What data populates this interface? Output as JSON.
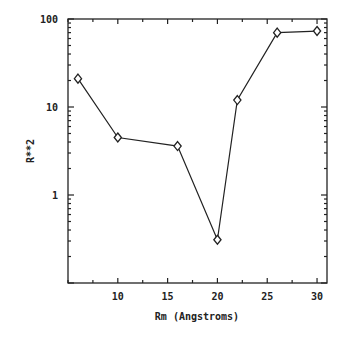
{
  "chart_data": {
    "type": "line",
    "title": "",
    "xlabel": "Rm (Angstroms)",
    "ylabel": "R**2",
    "xlim": [
      5,
      31
    ],
    "ylim": [
      0.1,
      100
    ],
    "yscale": "log",
    "grid": false,
    "legend": null,
    "x_ticks": [
      10,
      15,
      20,
      25,
      30
    ],
    "x_tick_labels": [
      "10",
      "15",
      "20",
      "25",
      "30"
    ],
    "x_minor_step": 2.5,
    "y_ticks": [
      1,
      10,
      100
    ],
    "y_tick_labels": [
      "1",
      "10",
      "100"
    ],
    "marker": "diamond",
    "series": [
      {
        "name": "R**2",
        "x": [
          6,
          10,
          16,
          20,
          22,
          26,
          30
        ],
        "y": [
          21,
          4.5,
          3.6,
          0.31,
          12,
          70,
          73
        ]
      }
    ],
    "colors": {
      "line": "#222222",
      "axis": "#222222",
      "background": "#ffffff"
    }
  }
}
